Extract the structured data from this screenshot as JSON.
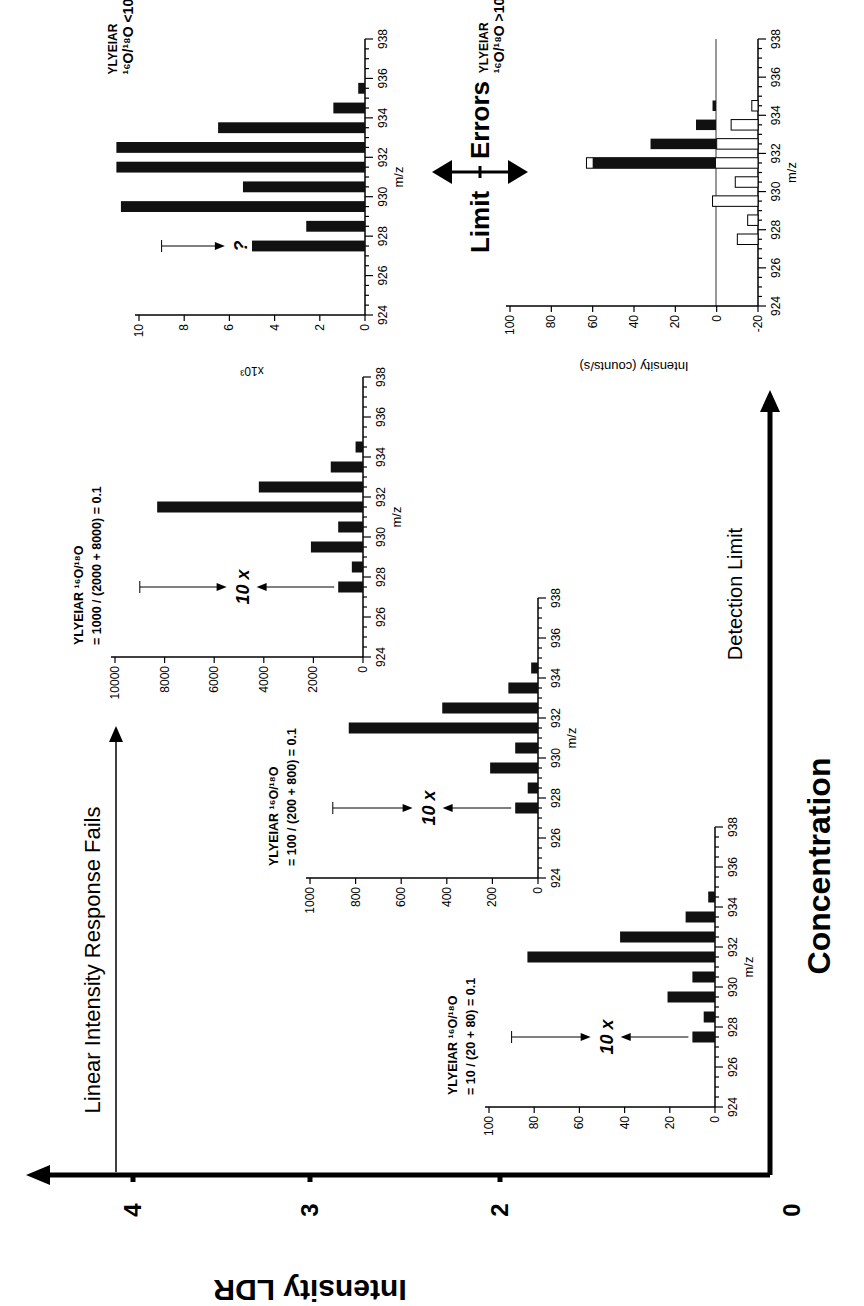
{
  "figure": {
    "rotation_deg": -90,
    "main_axes": {
      "x_label": "Concentration",
      "y_label": "Intensity LDR",
      "y_ticks": [
        "4",
        "3",
        "2",
        "0"
      ],
      "linear_response_label": "Linear Intensity Response Fails",
      "detection_limit_label": "Detection Limit",
      "limit_label": "Limit",
      "errors_label": "Errors"
    },
    "panels": [
      {
        "id": "A",
        "peptide": "YLYEIAR",
        "ratio_label": "16O/18O",
        "formula": "= 10 / (20 + 80) = 0.1",
        "annotation": "10 x",
        "yticks": [
          "0",
          "20",
          "40",
          "60",
          "80",
          "100"
        ],
        "xlabel": "m/z"
      },
      {
        "id": "B",
        "peptide": "YLYEIAR",
        "ratio_label": "16O/18O",
        "formula": "= 100 / (200 + 800) = 0.1",
        "annotation": "10 x",
        "yticks": [
          "0",
          "200",
          "400",
          "600",
          "800",
          "1000"
        ],
        "xlabel": "m/z"
      },
      {
        "id": "C",
        "peptide": "YLYEIAR",
        "ratio_label": "16O/18O",
        "formula": "= 1000 / (2000 + 8000) = 0.1",
        "annotation": "10 x",
        "yticks": [
          "0",
          "2000",
          "4000",
          "6000",
          "8000",
          "10000"
        ],
        "xlabel": "m/z"
      },
      {
        "id": "D",
        "peptide": "YLYEIAR",
        "ratio_label": "16O/18O <10",
        "annotation": "?",
        "yticks": [
          "0",
          "2",
          "4",
          "6",
          "8",
          "10"
        ],
        "yunit": "x10^3",
        "xlabel": "m/z"
      },
      {
        "id": "E",
        "peptide": "YLYEIAR",
        "ratio_label": "16O/18O >10",
        "yticks": [
          "-20",
          "0",
          "20",
          "40",
          "60",
          "80",
          "100"
        ],
        "ylabel": "Intensity (counts/s)",
        "xlabel": "m/z"
      }
    ],
    "xticks": [
      "924",
      "926",
      "928",
      "930",
      "932",
      "934",
      "936",
      "938"
    ]
  },
  "chart_data": [
    {
      "type": "bar",
      "title": "YLYEIAR 16O/18O = 10 / (20 + 80) = 0.1",
      "xlabel": "m/z",
      "ylabel": "",
      "x": [
        927.5,
        928.5,
        929.5,
        930.5,
        931.5,
        932.5,
        933.5,
        934.5
      ],
      "values": [
        10,
        5,
        21,
        10,
        83,
        42,
        13,
        3
      ],
      "xlim": [
        924,
        938
      ],
      "ylim": [
        0,
        100
      ]
    },
    {
      "type": "bar",
      "title": "YLYEIAR 16O/18O = 100 / (200 + 800) = 0.1",
      "xlabel": "m/z",
      "ylabel": "",
      "x": [
        927.5,
        928.5,
        929.5,
        930.5,
        931.5,
        932.5,
        933.5,
        934.5
      ],
      "values": [
        100,
        45,
        210,
        100,
        830,
        420,
        130,
        30
      ],
      "xlim": [
        924,
        938
      ],
      "ylim": [
        0,
        1000
      ]
    },
    {
      "type": "bar",
      "title": "YLYEIAR 16O/18O = 1000 / (2000 + 8000) = 0.1",
      "xlabel": "m/z",
      "ylabel": "",
      "x": [
        927.5,
        928.5,
        929.5,
        930.5,
        931.5,
        932.5,
        933.5,
        934.5
      ],
      "values": [
        1000,
        450,
        2100,
        1000,
        8300,
        4200,
        1300,
        300
      ],
      "xlim": [
        924,
        938
      ],
      "ylim": [
        0,
        10000
      ]
    },
    {
      "type": "bar",
      "title": "YLYEIAR 16O/18O <10",
      "xlabel": "m/z",
      "ylabel": "x10^3",
      "x": [
        927.5,
        928.5,
        929.5,
        930.5,
        931.5,
        932.5,
        933.5,
        934.5,
        935.5
      ],
      "values": [
        5.0,
        2.6,
        10.8,
        5.4,
        11.0,
        11.0,
        6.5,
        1.4,
        0.3
      ],
      "xlim": [
        924,
        938
      ],
      "ylim": [
        0,
        11
      ]
    },
    {
      "type": "bar",
      "title": "YLYEIAR 16O/18O >10",
      "xlabel": "m/z",
      "ylabel": "Intensity (counts/s)",
      "x": [
        927.5,
        928.5,
        929.5,
        930.5,
        931.5,
        932.5,
        933.5,
        934.5,
        935.5
      ],
      "series": [
        {
          "name": "measured (filled)",
          "values": [
            0,
            0,
            0,
            0,
            60,
            32,
            10,
            2,
            0
          ]
        },
        {
          "name": "open bars (top value, from -20 baseline)",
          "values": [
            -10,
            -15,
            2,
            -9,
            63,
            0,
            -7,
            -17,
            -20
          ]
        }
      ],
      "xlim": [
        924,
        938
      ],
      "ylim": [
        -20,
        100
      ]
    }
  ]
}
